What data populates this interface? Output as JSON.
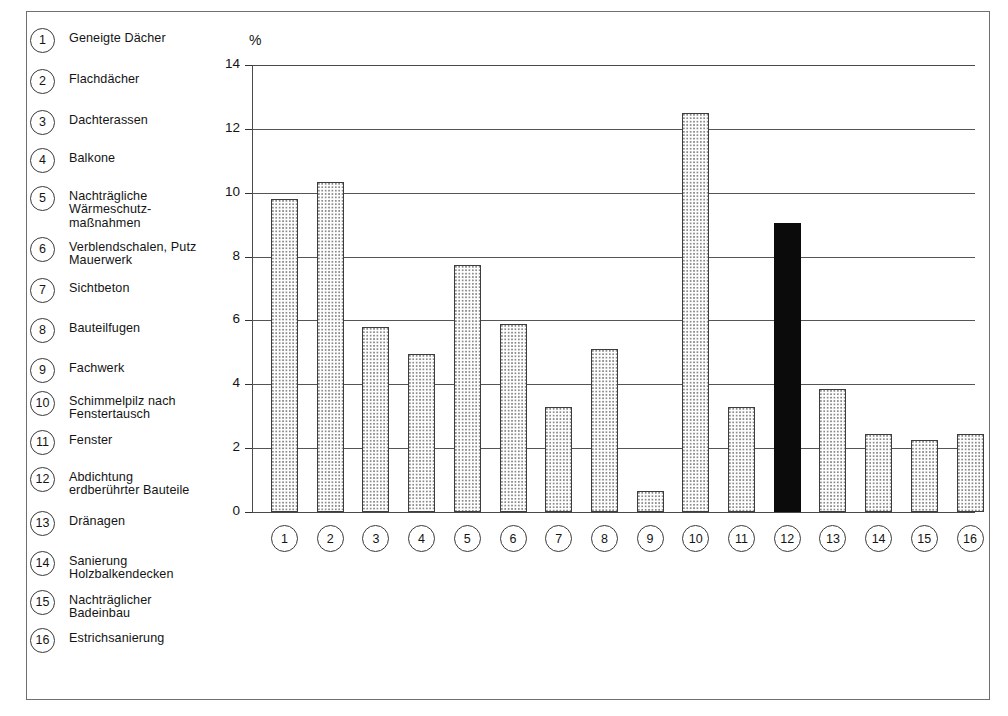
{
  "chart_data": {
    "type": "bar",
    "title": "",
    "xlabel": "",
    "ylabel": "%",
    "ylim": [
      0,
      14
    ],
    "yticks": [
      0,
      2,
      4,
      6,
      8,
      10,
      12,
      14
    ],
    "grid": true,
    "legend_position": "left",
    "categories": [
      "1",
      "2",
      "3",
      "4",
      "5",
      "6",
      "7",
      "8",
      "9",
      "10",
      "11",
      "12",
      "13",
      "14",
      "15",
      "16"
    ],
    "category_labels": [
      "Geneigte Dächer",
      "Flachdächer",
      "Dachterassen",
      "Balkone",
      "Nachträgliche\nWärmeschutz-\nmaßnahmen",
      "Verblendschalen, Putz\nMauerwerk",
      "Sichtbeton",
      "Bauteilfugen",
      "Fachwerk",
      "Schimmelpilz nach\nFenstertausch",
      "Fenster",
      "Abdichtung\nerdberührter Bauteile",
      "Dränagen",
      "Sanierung\nHolzbalkendecken",
      "Nachträglicher\nBadeinbau",
      "Estrichsanierung"
    ],
    "values": [
      9.8,
      10.35,
      5.8,
      4.95,
      7.75,
      5.9,
      3.3,
      5.1,
      0.65,
      12.5,
      3.3,
      9.05,
      3.85,
      2.45,
      2.25,
      2.45
    ],
    "highlighted_index": 11,
    "colors": {
      "bar_fill": "#fdfdfd",
      "bar_dot": "#8a8a8a",
      "bar_outline": "#3d3d3d",
      "highlight_bar": "#0b0b0b",
      "gridline": "#555555",
      "frame": "#6f6f6f",
      "text": "#141414"
    }
  },
  "legend": {
    "items": [
      {
        "number": "1",
        "label": "Geneigte Dächer"
      },
      {
        "number": "2",
        "label": "Flachdächer"
      },
      {
        "number": "3",
        "label": "Dachterassen"
      },
      {
        "number": "4",
        "label": "Balkone"
      },
      {
        "number": "5",
        "label": "Nachträgliche\nWärmeschutz-\nmaßnahmen"
      },
      {
        "number": "6",
        "label": "Verblendschalen, Putz\nMauerwerk"
      },
      {
        "number": "7",
        "label": "Sichtbeton"
      },
      {
        "number": "8",
        "label": "Bauteilfugen"
      },
      {
        "number": "9",
        "label": "Fachwerk"
      },
      {
        "number": "10",
        "label": "Schimmelpilz nach\nFenstertausch"
      },
      {
        "number": "11",
        "label": "Fenster"
      },
      {
        "number": "12",
        "label": "Abdichtung\nerdberührter Bauteile"
      },
      {
        "number": "13",
        "label": "Dränagen"
      },
      {
        "number": "14",
        "label": "Sanierung\nHolzbalkendecken"
      },
      {
        "number": "15",
        "label": "Nachträglicher\nBadeinbau"
      },
      {
        "number": "16",
        "label": "Estrichsanierung"
      }
    ]
  },
  "axis": {
    "unit_label": "%",
    "ytick_labels": [
      "0",
      "2",
      "4",
      "6",
      "8",
      "10",
      "12",
      "14"
    ]
  }
}
